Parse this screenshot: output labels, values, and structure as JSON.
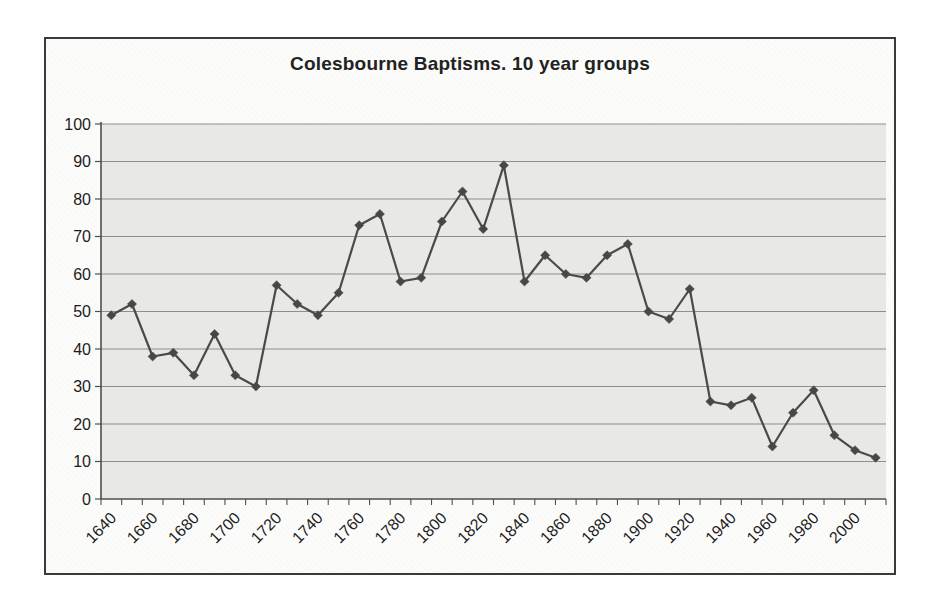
{
  "window": {
    "background_color": "#ffffff",
    "frame_border_color": "#3a3a3a"
  },
  "chart_data": {
    "type": "line",
    "title": "Colesbourne Baptisms. 10 year groups",
    "xlabel": "",
    "ylabel": "",
    "categories": [
      1640,
      1650,
      1660,
      1670,
      1680,
      1690,
      1700,
      1710,
      1720,
      1730,
      1740,
      1750,
      1760,
      1770,
      1780,
      1790,
      1800,
      1810,
      1820,
      1830,
      1840,
      1850,
      1860,
      1870,
      1880,
      1890,
      1900,
      1910,
      1920,
      1930,
      1940,
      1950,
      1960,
      1970,
      1980,
      1990,
      2000,
      2010
    ],
    "values": [
      49,
      52,
      38,
      39,
      33,
      44,
      33,
      30,
      57,
      52,
      49,
      55,
      73,
      76,
      58,
      59,
      74,
      82,
      72,
      89,
      58,
      65,
      60,
      59,
      65,
      68,
      50,
      48,
      56,
      26,
      25,
      27,
      14,
      23,
      29,
      17,
      13,
      11
    ],
    "ylim": [
      0,
      100
    ],
    "y_tick_step": 10,
    "y_tick_labels": [
      "0",
      "10",
      "20",
      "30",
      "40",
      "50",
      "60",
      "70",
      "80",
      "90",
      "100"
    ],
    "x_tick_labels": [
      "1640",
      "1660",
      "1680",
      "1700",
      "1720",
      "1740",
      "1760",
      "1780",
      "1800",
      "1820",
      "1840",
      "1860",
      "1880",
      "1900",
      "1920",
      "1940",
      "1960",
      "1980",
      "2000"
    ],
    "x_label_interval_years": 20,
    "grid": "horizontal",
    "legend_position": "none",
    "marker_shape": "diamond",
    "colors": {
      "line": "#4a4a4a",
      "marker": "#474747",
      "plot_fill": "#e8e8e4",
      "gridline": "#8e8e8e",
      "axis": "#4f4f4f",
      "tick": "#4f4f4f",
      "label_text": "#1c1c1c",
      "title_text": "#222222"
    }
  }
}
